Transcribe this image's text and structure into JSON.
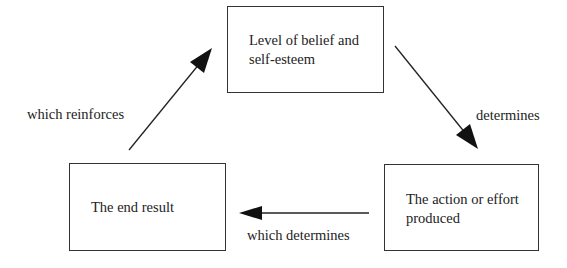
{
  "diagram": {
    "nodes": [
      {
        "id": "belief",
        "text": "Level of belief and\nself-esteem"
      },
      {
        "id": "action",
        "text": "The action or effort\nproduced"
      },
      {
        "id": "result",
        "text": "The end result"
      }
    ],
    "edges": [
      {
        "from": "belief",
        "to": "action",
        "label": "determines"
      },
      {
        "from": "action",
        "to": "result",
        "label": "which determines"
      },
      {
        "from": "result",
        "to": "belief",
        "label": "which reinforces"
      }
    ]
  }
}
